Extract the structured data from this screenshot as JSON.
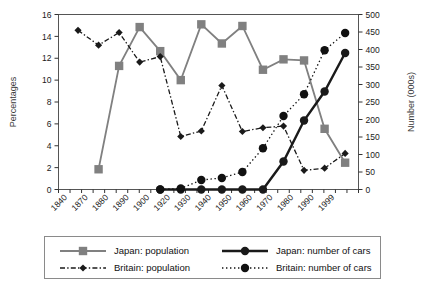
{
  "chart_data": {
    "type": "line",
    "title": "",
    "subtitle": "",
    "xlabel": "",
    "ylabel": "Percentages",
    "y2label": "Number (000s)",
    "categories": [
      "1840",
      "1870",
      "1880",
      "1890",
      "1900",
      "1920",
      "1930",
      "1940",
      "1950",
      "1960",
      "1970",
      "1980",
      "1990",
      "1999"
    ],
    "ylim": [
      0,
      16
    ],
    "yticks": [
      "0",
      "2",
      "4",
      "6",
      "8",
      "10",
      "12",
      "14",
      "16"
    ],
    "y2lim": [
      0,
      500
    ],
    "y2ticks": [
      "0",
      "50",
      "100",
      "150",
      "200",
      "250",
      "300",
      "350",
      "400",
      "450",
      "500"
    ],
    "grid": false,
    "legend_position": "bottom",
    "series": [
      {
        "name": "Japan: population",
        "axis": "left",
        "units": "percent",
        "color": "#808080",
        "marker": "square",
        "dash": "solid",
        "x": [
          "1870",
          "1880",
          "1890",
          "1900",
          "1920",
          "1930",
          "1940",
          "1950",
          "1960",
          "1970",
          "1980",
          "1990",
          "1999"
        ],
        "values": [
          1.85,
          11.3,
          14.85,
          12.65,
          10.0,
          15.1,
          13.35,
          14.95,
          10.95,
          11.9,
          11.8,
          5.55,
          2.45
        ]
      },
      {
        "name": "Britain: population",
        "axis": "left",
        "units": "percent",
        "color": "#1a1a1a",
        "marker": "diamond",
        "dash": "dashdot",
        "x": [
          "1840",
          "1870",
          "1880",
          "1890",
          "1900",
          "1920",
          "1930",
          "1940",
          "1950",
          "1960",
          "1970",
          "1980",
          "1990",
          "1999"
        ],
        "values": [
          14.55,
          13.2,
          14.35,
          11.65,
          12.15,
          4.85,
          5.35,
          9.5,
          5.3,
          5.65,
          5.8,
          1.75,
          1.95,
          3.3
        ]
      },
      {
        "name": "Japan: number of cars",
        "axis": "right",
        "units": "thousands",
        "color": "#1a1a1a",
        "marker": "circle",
        "dash": "solid",
        "x": [
          "1900",
          "1920",
          "1930",
          "1940",
          "1950",
          "1960",
          "1970",
          "1980",
          "1990",
          "1999"
        ],
        "values": [
          0,
          0,
          0,
          0,
          0,
          0,
          80,
          197,
          280,
          390
        ]
      },
      {
        "name": "Britain: number of cars",
        "axis": "right",
        "units": "thousands",
        "color": "#111111",
        "marker": "circle",
        "dash": "dotted",
        "x": [
          "1900",
          "1920",
          "1930",
          "1940",
          "1950",
          "1960",
          "1970",
          "1980",
          "1990",
          "1999"
        ],
        "values": [
          0,
          3,
          27,
          33,
          50,
          118,
          210,
          272,
          398,
          447
        ]
      }
    ]
  },
  "legend": {
    "entries": [
      {
        "label": "Japan: population",
        "color": "#808080",
        "marker": "square",
        "dash": "solid"
      },
      {
        "label": "Japan: number of cars",
        "color": "#1a1a1a",
        "marker": "circle",
        "dash": "solid"
      },
      {
        "label": "Britain: population",
        "color": "#1a1a1a",
        "marker": "diamond",
        "dash": "dashdot"
      },
      {
        "label": "Britain: number of cars",
        "color": "#111111",
        "marker": "circle",
        "dash": "dotted"
      }
    ]
  }
}
